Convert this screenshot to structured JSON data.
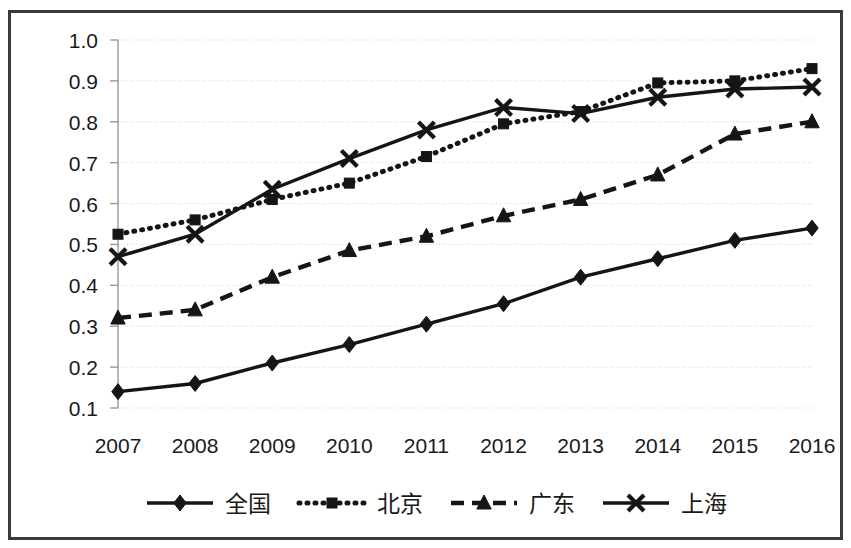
{
  "chart_data": {
    "type": "line",
    "title": "",
    "subtitle": "",
    "xlabel": "",
    "ylabel": "",
    "categories": [
      "2007",
      "2008",
      "2009",
      "2010",
      "2011",
      "2012",
      "2013",
      "2014",
      "2015",
      "2016"
    ],
    "ylim": [
      0.1,
      1.0
    ],
    "yticks": [
      "1.0",
      "0.9",
      "0.8",
      "0.7",
      "0.6",
      "0.5",
      "0.4",
      "0.3",
      "0.2",
      "0.1"
    ],
    "ytick_values": [
      1.0,
      0.9,
      0.8,
      0.7,
      0.6,
      0.5,
      0.4,
      0.3,
      0.2,
      0.1
    ],
    "grid": true,
    "grid_axis": "y",
    "legend_position": "bottom",
    "series": [
      {
        "name": "全国",
        "marker": "diamond",
        "line_style": "solid",
        "values": [
          0.14,
          0.16,
          0.21,
          0.255,
          0.305,
          0.355,
          0.42,
          0.465,
          0.51,
          0.54
        ]
      },
      {
        "name": "北京",
        "marker": "square",
        "line_style": "dotted",
        "values": [
          0.525,
          0.56,
          0.61,
          0.65,
          0.715,
          0.795,
          0.825,
          0.895,
          0.9,
          0.93
        ]
      },
      {
        "name": "广东",
        "marker": "triangle",
        "line_style": "dashed",
        "values": [
          0.32,
          0.34,
          0.42,
          0.485,
          0.52,
          0.57,
          0.61,
          0.67,
          0.77,
          0.8
        ]
      },
      {
        "name": "上海",
        "marker": "cross",
        "line_style": "solid",
        "values": [
          0.47,
          0.525,
          0.635,
          0.71,
          0.78,
          0.835,
          0.82,
          0.86,
          0.88,
          0.885
        ]
      }
    ]
  },
  "colors": {
    "series": "#151515",
    "grid": "#d6d6d6",
    "axis": "#9a9a9a",
    "frame": "#3a3a3a",
    "background": "#ffffff",
    "text": "#1a1a1a"
  },
  "legend": {
    "items": [
      {
        "label": "全国",
        "marker": "diamond-marker",
        "line": "solid"
      },
      {
        "label": "北京",
        "marker": "square-marker",
        "line": "dotted"
      },
      {
        "label": "广东",
        "marker": "triangle-marker",
        "line": "dashed"
      },
      {
        "label": "上海",
        "marker": "cross-marker",
        "line": "solid"
      }
    ]
  }
}
